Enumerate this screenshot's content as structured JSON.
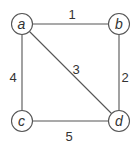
{
  "diagram": {
    "type": "weighted-undirected-graph",
    "colors": {
      "stroke": "#555555",
      "text": "#333333",
      "background": "#ffffff"
    },
    "nodes": [
      {
        "id": "a",
        "label": "a",
        "x": 22,
        "y": 24
      },
      {
        "id": "b",
        "label": "b",
        "x": 119,
        "y": 24
      },
      {
        "id": "c",
        "label": "c",
        "x": 22,
        "y": 121
      },
      {
        "id": "d",
        "label": "d",
        "x": 119,
        "y": 121
      }
    ],
    "edges": [
      {
        "from": "a",
        "to": "b",
        "weight": "1",
        "lx": 72,
        "ly": 19
      },
      {
        "from": "b",
        "to": "d",
        "weight": "2",
        "lx": 125,
        "ly": 78
      },
      {
        "from": "a",
        "to": "d",
        "weight": "3",
        "lx": 76,
        "ly": 70
      },
      {
        "from": "a",
        "to": "c",
        "weight": "4",
        "lx": 12,
        "ly": 78
      },
      {
        "from": "c",
        "to": "d",
        "weight": "5",
        "lx": 69,
        "ly": 138
      }
    ]
  }
}
